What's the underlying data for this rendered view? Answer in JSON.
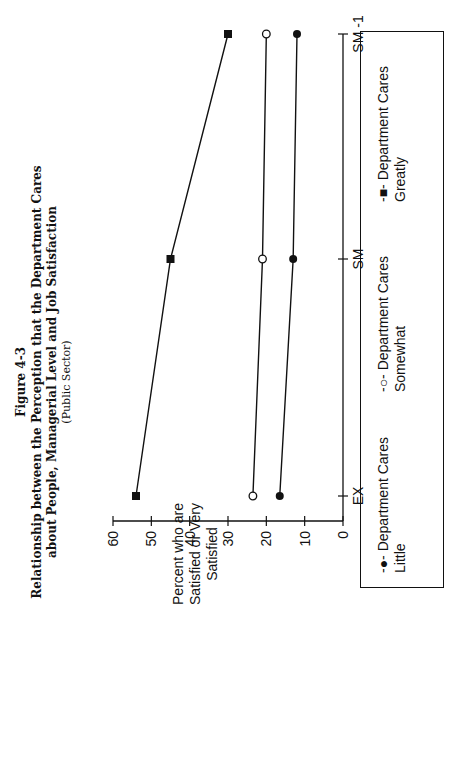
{
  "figure": {
    "number": "Figure 4-3",
    "title_line1": "Relationship between the Perception that the Department Cares",
    "title_line2": "about People, Managerial Level and Job Satisfaction",
    "subtitle": "(Public Sector)"
  },
  "y_axis_label": "Percent who are Satisfied or Very Satisfied",
  "legend": [
    {
      "marker": "-●-",
      "label": "Department Cares Little"
    },
    {
      "marker": "-○-",
      "label": "Department Cares Somewhat"
    },
    {
      "marker": "-■-",
      "label": "Department Cares Greatly"
    }
  ],
  "chart_data": {
    "type": "line",
    "title": "Relationship between the Perception that the Department Cares about People, Managerial Level and Job Satisfaction (Public Sector)",
    "xlabel": "",
    "ylabel": "Percent who are Satisfied or Very Satisfied",
    "categories": [
      "EX",
      "SM",
      "SM -1"
    ],
    "series": [
      {
        "name": "Department Cares Little",
        "marker": "filled-circle",
        "values": [
          16.5,
          13,
          12
        ]
      },
      {
        "name": "Department Cares Somewhat",
        "marker": "open-circle",
        "values": [
          23.5,
          21,
          20
        ]
      },
      {
        "name": "Department Cares Greatly",
        "marker": "filled-square",
        "values": [
          54,
          45,
          30
        ]
      }
    ],
    "yticks": [
      0,
      10,
      20,
      30,
      40,
      50,
      60
    ],
    "ylim": [
      0,
      60
    ],
    "grid": false,
    "legend_position": "bottom",
    "orientation_note": "page rotated 90° counter-clockwise"
  }
}
